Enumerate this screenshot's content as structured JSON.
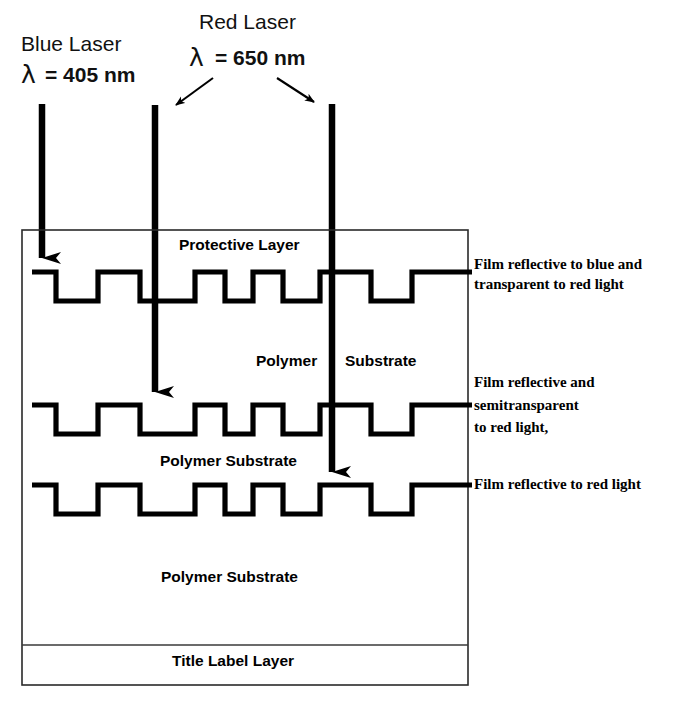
{
  "figure": {
    "background_color": "#ffffff",
    "ink_color": "#000000"
  },
  "lasers": [
    {
      "id": "blue-laser",
      "name_line": "Blue Laser",
      "lambda_symbol": "λ",
      "wavelength_line": "=  405 nm",
      "wavelength_value": 405,
      "wavelength_unit": "nm",
      "beam_x": 42,
      "beam_top_y": 104,
      "beam_tip_y": 278,
      "target_layer": "layer-1"
    },
    {
      "id": "red-laser",
      "name_line": "Red Laser",
      "lambda_symbol": "λ",
      "wavelength_line": "=  650 nm",
      "wavelength_value": 650,
      "wavelength_unit": "nm",
      "beams": [
        {
          "id": "red-beam-left",
          "beam_x": 155,
          "beam_top_y": 105,
          "beam_tip_y": 412,
          "target_layer": "layer-2"
        },
        {
          "id": "red-beam-right",
          "beam_x": 332,
          "beam_top_y": 104,
          "beam_tip_y": 492,
          "target_layer": "layer-3"
        }
      ]
    }
  ],
  "pointer_arrows": [
    {
      "id": "red-pointer-left",
      "x1": 213,
      "y1": 78,
      "x2": 172,
      "y2": 108
    },
    {
      "id": "red-pointer-right",
      "x1": 277,
      "y1": 78,
      "x2": 318,
      "y2": 105
    }
  ],
  "disc_stack": {
    "box": {
      "x": 22,
      "y": 230,
      "width": 446,
      "height": 455
    },
    "internal_labels": [
      {
        "id": "protective-layer-label",
        "text": "Protective Layer",
        "x": 179,
        "y": 250
      },
      {
        "id": "polymer-label-mid",
        "text": "Polymer",
        "x": 256,
        "y": 366
      },
      {
        "id": "substrate-label-mid",
        "text": "Substrate",
        "x": 345,
        "y": 366
      },
      {
        "id": "polymer-substrate-label-3",
        "text": "Polymer Substrate",
        "x": 160,
        "y": 466
      },
      {
        "id": "polymer-substrate-label-4",
        "text": "Polymer Substrate",
        "x": 161,
        "y": 582
      },
      {
        "id": "title-label-layer",
        "text": "Title  Label Layer",
        "x": 172,
        "y": 666
      }
    ],
    "layers": [
      {
        "id": "layer-1",
        "baseline_y": 272,
        "pit_depth": 29,
        "side_label_lines": [
          "Film reflective to blue and",
          " transparent to red light"
        ],
        "side_label_x": 474,
        "side_label_y": 269
      },
      {
        "id": "layer-2",
        "baseline_y": 405,
        "pit_depth": 29,
        "side_label_lines": [
          "Film reflective and",
          "semitransparent",
          " to red light,"
        ],
        "side_label_x": 474,
        "side_label_y": 387
      },
      {
        "id": "layer-3",
        "baseline_y": 485,
        "pit_depth": 29,
        "side_label_lines": [
          "Film reflective to red light"
        ],
        "side_label_x": 474,
        "side_label_y": 489
      }
    ],
    "pit_pattern": {
      "start_x": 32,
      "end_x": 472,
      "segments": [
        {
          "pit_start": 56,
          "pit_end": 98
        },
        {
          "pit_start": 140,
          "pit_end": 195
        },
        {
          "pit_start": 225,
          "pit_end": 253
        },
        {
          "pit_start": 283,
          "pit_end": 320
        },
        {
          "pit_start": 371,
          "pit_end": 412
        }
      ]
    },
    "title_label_divider_y": 645
  }
}
